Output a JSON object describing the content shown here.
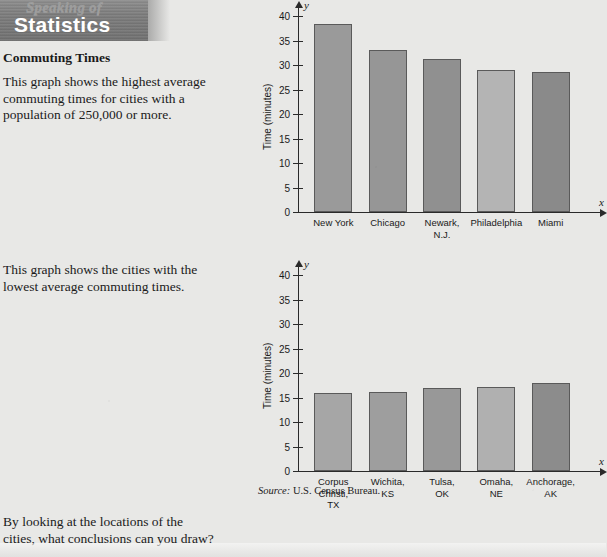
{
  "banner": {
    "line1": "Speaking of",
    "line2": "Statistics"
  },
  "article": {
    "title": "Commuting Times",
    "paragraph1": "This graph shows the highest average commuting times for cities with a population of 250,000 or more.",
    "paragraph2": "This graph shows the cities with the lowest average commuting times.",
    "paragraph3": "By looking at the locations of the cities, what conclusions can you draw?"
  },
  "source": {
    "prefix": "Source:",
    "text": "U.S. Census Bureau."
  },
  "axis": {
    "x_letter": "x",
    "y_letter": "y"
  },
  "chart_data": [
    {
      "type": "bar",
      "id": "highest-commuting-times",
      "title": "",
      "xlabel": "",
      "ylabel": "Time (minutes)",
      "ylim": [
        0,
        40
      ],
      "ytick_step": 5,
      "yticks": [
        0,
        5,
        10,
        15,
        20,
        25,
        30,
        35,
        40
      ],
      "ytick_labels": [
        "0",
        "5",
        "10",
        "15",
        "20",
        "25",
        "30",
        "35",
        "40"
      ],
      "grid": false,
      "legend": "none",
      "categories": [
        "New York",
        "Chicago",
        "Newark,\nN.J.",
        "Philadelphia",
        "Miami"
      ],
      "category_labels": [
        "New York",
        "Chicago",
        "Newark, N.J.",
        "Philadelphia",
        "Miami"
      ],
      "values": [
        38.3,
        33.0,
        31.3,
        29.0,
        28.6
      ],
      "bar_colors": [
        "#9a9a9a",
        "#969696",
        "#909090",
        "#b4b4b4",
        "#8a8a8a"
      ]
    },
    {
      "type": "bar",
      "id": "lowest-commuting-times",
      "title": "",
      "xlabel": "",
      "ylabel": "Time (minutes)",
      "ylim": [
        0,
        40
      ],
      "ytick_step": 5,
      "yticks": [
        0,
        5,
        10,
        15,
        20,
        25,
        30,
        35,
        40
      ],
      "ytick_labels": [
        "0",
        "5",
        "10",
        "15",
        "20",
        "25",
        "30",
        "35",
        "40"
      ],
      "grid": false,
      "legend": "none",
      "categories": [
        "Corpus\nChristi,\nTX",
        "Wichita,\nKS",
        "Tulsa,\nOK",
        "Omaha,\nNE",
        "Anchorage,\nAK"
      ],
      "category_labels": [
        "Corpus Christi, TX",
        "Wichita, KS",
        "Tulsa, OK",
        "Omaha, NE",
        "Anchorage, AK"
      ],
      "values": [
        16.0,
        16.1,
        17.0,
        17.1,
        18.0
      ],
      "bar_colors": [
        "#a6a6a6",
        "#9e9e9e",
        "#989898",
        "#b0b0b0",
        "#8c8c8c"
      ]
    }
  ]
}
